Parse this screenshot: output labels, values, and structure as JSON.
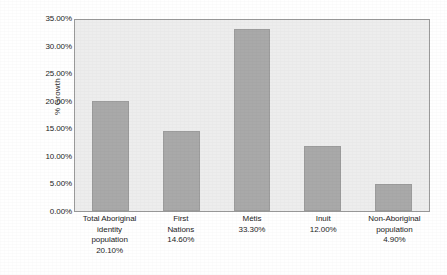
{
  "chart_data": {
    "type": "bar",
    "title": "",
    "subtitle": "",
    "xlabel": "",
    "ylabel": "% Growth",
    "categories": [
      "Total Aboriginal identity population",
      "First Nations",
      "Métis",
      "Inuit",
      "Non-Aboriginal population"
    ],
    "values": [
      20.1,
      14.6,
      33.3,
      12.0,
      4.9
    ],
    "value_labels": [
      "20.10%",
      "14.60%",
      "33.30%",
      "12.00%",
      "4.90%"
    ],
    "ylim": [
      0,
      35
    ],
    "ytick_values": [
      0,
      5,
      10,
      15,
      20,
      25,
      30,
      35
    ],
    "ytick_labels": [
      "0.00%",
      "5.00%",
      "10.00%",
      "15.00%",
      "20.00%",
      "25.00%",
      "30.00%",
      "35.00%"
    ],
    "grid": false,
    "legend": false,
    "legend_position": "none",
    "bar_color": "#a9a9a9",
    "bar_border_color": "#9c9c9c",
    "plot_background": "#ededed",
    "plot_border_color": "#9a9a9a",
    "page_background": "#ffffff",
    "text_color": "#1d1d1d",
    "x_tick_labels": [
      {
        "lines": [
          "Total Aboriginal",
          "identity",
          "population",
          "20.10%"
        ]
      },
      {
        "lines": [
          "First",
          "Nations",
          "14.60%"
        ]
      },
      {
        "lines": [
          "Métis",
          "33.30%"
        ]
      },
      {
        "lines": [
          "Inuit",
          "12.00%"
        ]
      },
      {
        "lines": [
          "Non-Aboriginal",
          "population",
          "4.90%"
        ]
      }
    ]
  }
}
